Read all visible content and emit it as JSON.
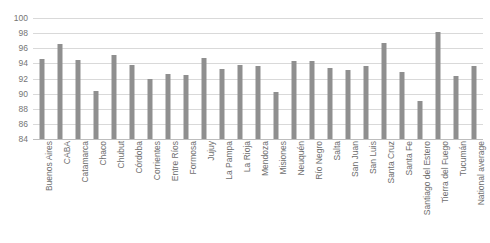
{
  "chart_data": {
    "type": "bar",
    "title": "",
    "subtitle": "",
    "xlabel": "",
    "ylabel": "",
    "ylim": [
      84,
      100
    ],
    "ytick_step": 2,
    "yticks": [
      84,
      86,
      88,
      90,
      92,
      94,
      96,
      98,
      100
    ],
    "grid": true,
    "legend": false,
    "bar_color": "#8f8f8f",
    "grid_color": "#d9d9d9",
    "axis_color": "#bdbdbd",
    "tick_label_color": "#757575",
    "categories": [
      "Buenos Aires",
      "CABA",
      "Catamarca",
      "Chaco",
      "Chubut",
      "Córdoba",
      "Corrientes",
      "Entre Ríos",
      "Formosa",
      "Jujuy",
      "La Pampa",
      "La Rioja",
      "Mendoza",
      "Misiones",
      "Neuquén",
      "Río Negro",
      "Salta",
      "San Juan",
      "San Luis",
      "Santa Cruz",
      "Santa Fe",
      "Santiago del Estero",
      "Tierra del Fuego",
      "Tucumán",
      "National average"
    ],
    "values": [
      94.6,
      96.6,
      94.4,
      90.4,
      95.1,
      93.8,
      92.0,
      92.6,
      92.5,
      94.7,
      93.3,
      93.8,
      93.6,
      90.2,
      94.3,
      94.3,
      93.4,
      93.1,
      93.6,
      96.7,
      92.8,
      89.0,
      98.2,
      92.3,
      93.7
    ]
  }
}
